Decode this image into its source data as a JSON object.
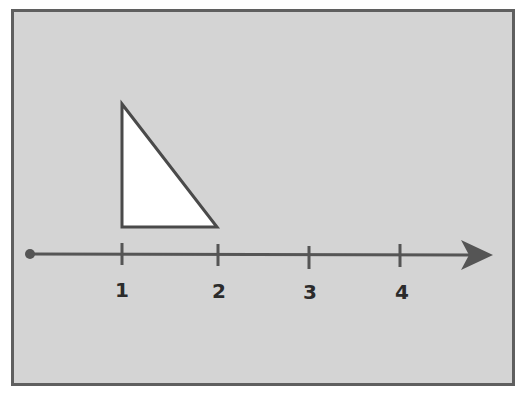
{
  "diagram": {
    "type": "number-line-with-triangle",
    "colors": {
      "background": "#d4d4d4",
      "frame": "#5f5f5f",
      "line": "#555555",
      "triangle_fill": "#ffffff",
      "triangle_stroke": "#4a4a4a",
      "label": "#2b2b2b"
    },
    "number_line": {
      "origin_marker": "dot",
      "direction": "arrow-right",
      "ticks": [
        {
          "value": 1,
          "label": "1"
        },
        {
          "value": 2,
          "label": "2"
        },
        {
          "value": 3,
          "label": "3"
        },
        {
          "value": 4,
          "label": "4"
        }
      ]
    },
    "triangle": {
      "kind": "right-triangle",
      "base_from": 1,
      "base_to": 2,
      "right_angle_at": "bottom-left (above 1)"
    }
  }
}
